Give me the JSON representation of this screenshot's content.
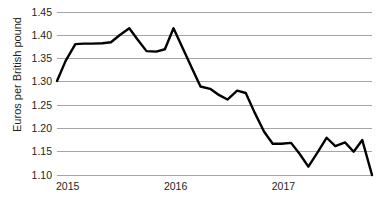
{
  "chart_data": {
    "type": "line",
    "title": "",
    "subtitle": "",
    "xlabel": "",
    "ylabel": "Euros per British pound",
    "ylim": [
      1.1,
      1.45
    ],
    "xlim": [
      2015.0,
      2017.92
    ],
    "grid": true,
    "grid_axis": "y",
    "legend": false,
    "legend_position": "none",
    "line_color": "#000000",
    "grid_color": "#a6a6a6",
    "background_color": "#ffffff",
    "y_ticks": [
      "1.10",
      "1.15",
      "1.20",
      "1.25",
      "1.30",
      "1.35",
      "1.40",
      "1.45"
    ],
    "y_tick_values": [
      1.1,
      1.15,
      1.2,
      1.25,
      1.3,
      1.35,
      1.4,
      1.45
    ],
    "x_ticks": [
      "2015",
      "2016",
      "2017"
    ],
    "x_tick_values": [
      2015.0,
      2016.0,
      2017.0
    ],
    "series": [
      {
        "name": "Euros per British pound",
        "x": [
          2015.0,
          2015.08,
          2015.17,
          2015.25,
          2015.33,
          2015.42,
          2015.5,
          2015.58,
          2015.67,
          2015.75,
          2015.83,
          2015.92,
          2016.0,
          2016.08,
          2016.17,
          2016.25,
          2016.33,
          2016.42,
          2016.5,
          2016.58,
          2016.67,
          2016.75,
          2016.83,
          2016.92,
          2017.0,
          2017.08,
          2017.17,
          2017.25,
          2017.33,
          2017.42,
          2017.5,
          2017.58,
          2017.67,
          2017.75,
          2017.83,
          2017.92
        ],
        "values": [
          1.302,
          1.345,
          1.381,
          1.382,
          1.382,
          1.383,
          1.385,
          1.4,
          1.415,
          1.39,
          1.366,
          1.365,
          1.37,
          1.415,
          1.37,
          1.33,
          1.29,
          1.285,
          1.272,
          1.262,
          1.281,
          1.276,
          1.235,
          1.193,
          1.167,
          1.167,
          1.169,
          1.145,
          1.118,
          1.15,
          1.18,
          1.162,
          1.17,
          1.15,
          1.175,
          1.1
        ]
      }
    ],
    "annotations": []
  },
  "axis": {
    "y_title": "Euros per British pound"
  }
}
